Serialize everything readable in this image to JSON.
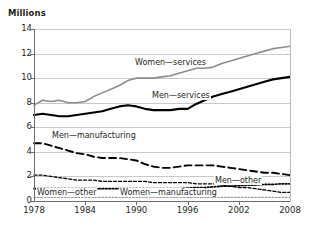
{
  "chart_data": {
    "type": "line",
    "title": "",
    "subtitle": "",
    "xlabel": "",
    "ylabel": "Millions",
    "ylim": [
      0,
      14
    ],
    "xlim": [
      1978,
      2008
    ],
    "grid": true,
    "legend_position": "inline-annotations",
    "y_ticks": [
      "0",
      "2",
      "4",
      "6",
      "8",
      "10",
      "12",
      "14"
    ],
    "y_tick_values": [
      0,
      2,
      4,
      6,
      8,
      10,
      12,
      14
    ],
    "x_ticks": [
      "1978",
      "1984",
      "1990",
      "1996",
      "2002",
      "2008"
    ],
    "x_tick_values": [
      1978,
      1984,
      1990,
      1996,
      2002,
      2008
    ],
    "x": [
      1978,
      1979,
      1980,
      1981,
      1982,
      1983,
      1984,
      1985,
      1986,
      1987,
      1988,
      1989,
      1990,
      1991,
      1992,
      1993,
      1994,
      1995,
      1996,
      1997,
      1998,
      1999,
      2000,
      2001,
      2002,
      2003,
      2004,
      2005,
      2006,
      2007,
      2008
    ],
    "series": [
      {
        "name": "Women—services",
        "color": "#8c8c8c",
        "style": "solid",
        "width": 1.6,
        "values": [
          7.8,
          8.2,
          8.1,
          8.2,
          8.0,
          8.0,
          8.1,
          8.5,
          8.8,
          9.1,
          9.4,
          9.8,
          10.0,
          10.0,
          10.0,
          10.1,
          10.2,
          10.4,
          10.6,
          10.8,
          10.8,
          10.9,
          11.2,
          11.4,
          11.6,
          11.8,
          12.0,
          12.2,
          12.4,
          12.5,
          12.6
        ]
      },
      {
        "name": "Men—services",
        "color": "#000000",
        "style": "solid",
        "width": 2.1,
        "values": [
          7.0,
          7.1,
          7.0,
          6.9,
          6.9,
          7.0,
          7.1,
          7.2,
          7.3,
          7.5,
          7.7,
          7.8,
          7.7,
          7.5,
          7.4,
          7.4,
          7.4,
          7.5,
          7.5,
          7.9,
          8.2,
          8.5,
          8.7,
          8.9,
          9.1,
          9.3,
          9.5,
          9.7,
          9.9,
          10.0,
          10.1
        ]
      },
      {
        "name": "Men—manufacturing",
        "color": "#000000",
        "style": "dashed",
        "width": 1.9,
        "values": [
          4.7,
          4.7,
          4.5,
          4.3,
          4.1,
          3.9,
          3.8,
          3.6,
          3.5,
          3.5,
          3.5,
          3.4,
          3.3,
          3.0,
          2.8,
          2.7,
          2.7,
          2.8,
          2.9,
          2.9,
          2.9,
          2.9,
          2.8,
          2.7,
          2.6,
          2.5,
          2.4,
          2.3,
          2.3,
          2.2,
          2.1
        ]
      },
      {
        "name": "Women—manufacturing",
        "color": "#000000",
        "style": "fine-dash",
        "width": 1.3,
        "values": [
          2.1,
          2.1,
          2.0,
          1.9,
          1.8,
          1.7,
          1.7,
          1.7,
          1.6,
          1.6,
          1.6,
          1.6,
          1.6,
          1.6,
          1.5,
          1.5,
          1.5,
          1.5,
          1.5,
          1.4,
          1.4,
          1.4,
          1.3,
          1.2,
          1.1,
          1.1,
          1.0,
          0.9,
          0.8,
          0.7,
          0.7
        ]
      },
      {
        "name": "Men—other",
        "color": "#000000",
        "style": "dotted",
        "width": 1.7,
        "values": [
          1.0,
          1.0,
          1.0,
          1.0,
          1.0,
          1.0,
          1.0,
          1.0,
          1.0,
          1.0,
          1.0,
          1.0,
          1.0,
          1.0,
          1.0,
          1.0,
          1.0,
          1.0,
          1.05,
          1.1,
          1.1,
          1.15,
          1.2,
          1.2,
          1.25,
          1.3,
          1.3,
          1.35,
          1.35,
          1.4,
          1.4
        ]
      },
      {
        "name": "Women—other",
        "color": "#9a9a9a",
        "style": "dotted",
        "width": 1.3,
        "values": [
          0.3,
          0.3,
          0.3,
          0.3,
          0.3,
          0.3,
          0.3,
          0.3,
          0.3,
          0.3,
          0.3,
          0.3,
          0.3,
          0.3,
          0.3,
          0.3,
          0.3,
          0.3,
          0.3,
          0.3,
          0.3,
          0.3,
          0.3,
          0.3,
          0.3,
          0.3,
          0.3,
          0.3,
          0.3,
          0.3,
          0.3
        ]
      }
    ],
    "annotations": [
      {
        "text": "Women—services",
        "series": "Women—services"
      },
      {
        "text": "Men—services",
        "series": "Men—services"
      },
      {
        "text": "Men—manufacturing",
        "series": "Men—manufacturing"
      },
      {
        "text": "Men—other",
        "series": "Men—other"
      },
      {
        "text": "Women—other",
        "series": "Women—other"
      },
      {
        "text": "Women—manufacturing",
        "series": "Women—manufacturing"
      }
    ]
  }
}
